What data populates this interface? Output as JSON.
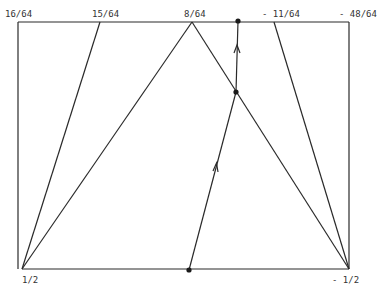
{
  "diagram": {
    "top_labels": [
      "16/64",
      "15/64",
      "8/64",
      "- 11/64",
      "- 48/64"
    ],
    "bottom_labels": [
      "1/2",
      "- 1/2"
    ],
    "nodes": [
      {
        "id": "top-dot",
        "kind": "marked-point"
      },
      {
        "id": "mid-dot",
        "kind": "marked-point"
      },
      {
        "id": "bottom-dot",
        "kind": "marked-point"
      }
    ],
    "paths": [
      {
        "id": "path-bottom-to-mid",
        "from": "bottom-dot",
        "to": "mid-dot",
        "arrow": "up"
      },
      {
        "id": "path-mid-to-top",
        "from": "mid-dot",
        "to": "top-dot",
        "arrow": "up"
      }
    ]
  }
}
